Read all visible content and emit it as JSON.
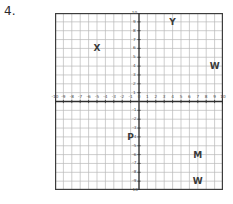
{
  "problem": {
    "number": "4."
  },
  "chart_data": {
    "type": "scatter",
    "title": "",
    "xlabel": "",
    "ylabel": "",
    "xlim": [
      -10,
      10
    ],
    "ylim": [
      -10,
      10
    ],
    "grid": true,
    "grid_step": 1,
    "legend": "none",
    "axis_arrows": true,
    "x_ticks": [
      -10,
      -9,
      -8,
      -7,
      -6,
      -5,
      -4,
      -3,
      -2,
      -1,
      0,
      1,
      2,
      3,
      4,
      5,
      6,
      7,
      8,
      9,
      10
    ],
    "x_tick_labels": [
      "-10",
      "-9",
      "-8",
      "-7",
      "-6",
      "-5",
      "-4",
      "-3",
      "-2",
      "-1",
      "0",
      "1",
      "2",
      "3",
      "4",
      "5",
      "6",
      "7",
      "8",
      "9",
      "10"
    ],
    "y_ticks": [
      -10,
      -9,
      -8,
      -7,
      -6,
      -5,
      -4,
      -3,
      -2,
      -1,
      1,
      2,
      3,
      4,
      5,
      6,
      7,
      8,
      9,
      10
    ],
    "y_tick_labels": [
      "-10",
      "-9",
      "-8",
      "-7",
      "-6",
      "-5",
      "-4",
      "-3",
      "-2",
      "-1",
      "1",
      "2",
      "3",
      "4",
      "5",
      "6",
      "7",
      "8",
      "9",
      "10"
    ],
    "points": [
      {
        "label": "X",
        "x": -5,
        "y": 6
      },
      {
        "label": "Y",
        "x": 4,
        "y": 9
      },
      {
        "label": "W",
        "x": 9,
        "y": 4
      },
      {
        "label": "P",
        "x": -1,
        "y": -4
      },
      {
        "label": "M",
        "x": 7,
        "y": -6
      },
      {
        "label": "W",
        "x": 7,
        "y": -9
      }
    ],
    "colors": {
      "grid_line": "#b9b9b9",
      "grid_border": "#3d3d3d",
      "axis": "#2f2f2f",
      "label_text": "#3a3a3a",
      "tick_text": "#4a4a4a",
      "background": "#ffffff"
    }
  }
}
